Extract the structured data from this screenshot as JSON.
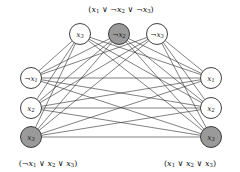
{
  "figure": {
    "background_color": "#ffffff",
    "edge_color": "#2b2b2b",
    "node_stroke_color": "#2b2b2b",
    "node_fill_white": "#ffffff",
    "node_fill_selected": "#9a9a9a",
    "node_radius": 10.5
  },
  "clauses": [
    {
      "id": "clause-top",
      "label": "(x1 ∨ ¬x2 ∨ ¬x3)",
      "label_parts": [
        {
          "t": "(",
          "k": "op"
        },
        {
          "t": "x",
          "k": "var"
        },
        {
          "t": "1",
          "k": "sub"
        },
        {
          "t": " ∨ ",
          "k": "op"
        },
        {
          "t": "¬",
          "k": "op"
        },
        {
          "t": "x",
          "k": "var"
        },
        {
          "t": "2",
          "k": "sub"
        },
        {
          "t": " ∨ ",
          "k": "op"
        },
        {
          "t": "¬",
          "k": "op"
        },
        {
          "t": "x",
          "k": "var"
        },
        {
          "t": "3",
          "k": "sub"
        },
        {
          "t": ")",
          "k": "op"
        }
      ],
      "label_x": 121,
      "label_y": 9,
      "position": "top"
    },
    {
      "id": "clause-left",
      "label": "(¬x1 ∨ x2 ∨ x3)",
      "label_parts": [
        {
          "t": "(",
          "k": "op"
        },
        {
          "t": "¬",
          "k": "op"
        },
        {
          "t": "x",
          "k": "var"
        },
        {
          "t": "1",
          "k": "sub"
        },
        {
          "t": " ∨ ",
          "k": "op"
        },
        {
          "t": "x",
          "k": "var"
        },
        {
          "t": "2",
          "k": "sub"
        },
        {
          "t": " ∨ ",
          "k": "op"
        },
        {
          "t": "x",
          "k": "var"
        },
        {
          "t": "3",
          "k": "sub"
        },
        {
          "t": ")",
          "k": "op"
        }
      ],
      "label_x": 48,
      "label_y": 163,
      "position": "bottom-left"
    },
    {
      "id": "clause-right",
      "label": "(x1 ∨ x2 ∨ x3)",
      "label_parts": [
        {
          "t": "(",
          "k": "op"
        },
        {
          "t": "x",
          "k": "var"
        },
        {
          "t": "1",
          "k": "sub"
        },
        {
          "t": " ∨ ",
          "k": "op"
        },
        {
          "t": "x",
          "k": "var"
        },
        {
          "t": "2",
          "k": "sub"
        },
        {
          "t": " ∨ ",
          "k": "op"
        },
        {
          "t": "x",
          "k": "var"
        },
        {
          "t": "3",
          "k": "sub"
        },
        {
          "t": ")",
          "k": "op"
        }
      ],
      "label_x": 190,
      "label_y": 163,
      "position": "bottom-right"
    }
  ],
  "nodes": [
    {
      "id": "t0",
      "group": "clause-top",
      "literal": "x3",
      "neg": false,
      "var": "x",
      "sub": "3",
      "selected": false,
      "cx": 80,
      "cy": 34
    },
    {
      "id": "t1",
      "group": "clause-top",
      "literal": "¬x2",
      "neg": true,
      "var": "x",
      "sub": "2",
      "selected": true,
      "cx": 119,
      "cy": 34
    },
    {
      "id": "t2",
      "group": "clause-top",
      "literal": "¬x3",
      "neg": true,
      "var": "x",
      "sub": "3",
      "selected": false,
      "cx": 157,
      "cy": 34
    },
    {
      "id": "l0",
      "group": "clause-left",
      "literal": "¬x1",
      "neg": true,
      "var": "x",
      "sub": "1",
      "selected": false,
      "cx": 31,
      "cy": 78
    },
    {
      "id": "l1",
      "group": "clause-left",
      "literal": "x2",
      "neg": false,
      "var": "x",
      "sub": "2",
      "selected": false,
      "cx": 31,
      "cy": 108
    },
    {
      "id": "l2",
      "group": "clause-left",
      "literal": "x3",
      "neg": false,
      "var": "x",
      "sub": "3",
      "selected": true,
      "cx": 31,
      "cy": 137
    },
    {
      "id": "r0",
      "group": "clause-right",
      "literal": "x1",
      "neg": false,
      "var": "x",
      "sub": "1",
      "selected": false,
      "cx": 211,
      "cy": 78
    },
    {
      "id": "r1",
      "group": "clause-right",
      "literal": "x2",
      "neg": false,
      "var": "x",
      "sub": "2",
      "selected": false,
      "cx": 211,
      "cy": 108
    },
    {
      "id": "r2",
      "group": "clause-right",
      "literal": "x3",
      "neg": false,
      "var": "x",
      "sub": "3",
      "selected": true,
      "cx": 211,
      "cy": 137
    }
  ],
  "edges": [
    {
      "from": "t0",
      "to": "l0"
    },
    {
      "from": "t0",
      "to": "l1"
    },
    {
      "from": "t0",
      "to": "l2"
    },
    {
      "from": "t0",
      "to": "r0"
    },
    {
      "from": "t0",
      "to": "r1"
    },
    {
      "from": "t0",
      "to": "r2"
    },
    {
      "from": "t1",
      "to": "l0"
    },
    {
      "from": "t1",
      "to": "l1"
    },
    {
      "from": "t1",
      "to": "l2"
    },
    {
      "from": "t1",
      "to": "r0"
    },
    {
      "from": "t1",
      "to": "r1"
    },
    {
      "from": "t1",
      "to": "r2"
    },
    {
      "from": "t2",
      "to": "l0"
    },
    {
      "from": "t2",
      "to": "l1"
    },
    {
      "from": "t2",
      "to": "l2"
    },
    {
      "from": "t2",
      "to": "r0"
    },
    {
      "from": "t2",
      "to": "r1"
    },
    {
      "from": "t2",
      "to": "r2"
    },
    {
      "from": "l0",
      "to": "r0"
    },
    {
      "from": "l0",
      "to": "r1"
    },
    {
      "from": "l0",
      "to": "r2"
    },
    {
      "from": "l1",
      "to": "r0"
    },
    {
      "from": "l1",
      "to": "r1"
    },
    {
      "from": "l1",
      "to": "r2"
    },
    {
      "from": "l2",
      "to": "r0"
    },
    {
      "from": "l2",
      "to": "r1"
    },
    {
      "from": "l2",
      "to": "r2"
    }
  ]
}
